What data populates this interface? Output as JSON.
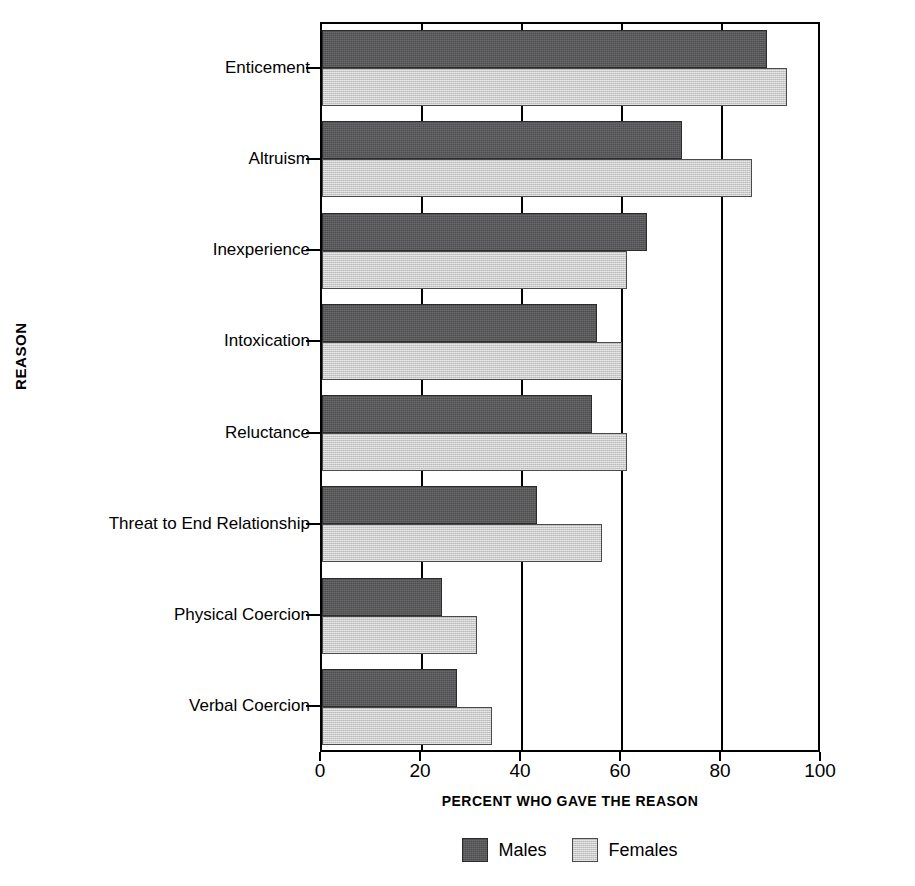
{
  "chart_data": {
    "type": "bar",
    "orientation": "horizontal",
    "title": "",
    "xlabel": "PERCENT WHO GAVE THE REASON",
    "ylabel": "REASON",
    "xlim": [
      0,
      100
    ],
    "xticks": [
      0,
      20,
      40,
      60,
      80,
      100
    ],
    "grid": true,
    "grid_axis": "x",
    "legend_position": "bottom-center",
    "categories": [
      "Enticement",
      "Altruism",
      "Inexperience",
      "Intoxication",
      "Reluctance",
      "Threat to End Relationship",
      "Physical Coercion",
      "Verbal Coercion"
    ],
    "series": [
      {
        "name": "Males",
        "color": "#58585a",
        "values": [
          89,
          72,
          65,
          55,
          54,
          43,
          24,
          27
        ]
      },
      {
        "name": "Females",
        "color": "#c9c9c9",
        "values": [
          93,
          86,
          61,
          60,
          61,
          56,
          31,
          34
        ]
      }
    ]
  },
  "legend": {
    "items": [
      {
        "label": "Males",
        "swatch": "males-swatch"
      },
      {
        "label": "Females",
        "swatch": "females-swatch"
      }
    ]
  }
}
